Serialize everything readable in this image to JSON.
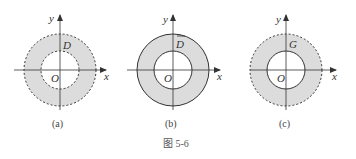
{
  "figure": {
    "caption": "图 5-6",
    "colors": {
      "fill": "#dcdcdc",
      "stroke": "#333333",
      "background": "#ffffff"
    },
    "panels": [
      {
        "id": "a",
        "sublabel": "(a)",
        "region_label": "D",
        "region_overline": false,
        "origin_label": "O",
        "x_axis_label": "x",
        "y_axis_label": "y",
        "outer_boundary": "dashed",
        "inner_boundary": "dashed"
      },
      {
        "id": "b",
        "sublabel": "(b)",
        "region_label": "D",
        "region_overline": true,
        "origin_label": "O",
        "x_axis_label": "x",
        "y_axis_label": "y",
        "outer_boundary": "solid",
        "inner_boundary": "solid"
      },
      {
        "id": "c",
        "sublabel": "(c)",
        "region_label": "G",
        "region_overline": false,
        "origin_label": "O",
        "x_axis_label": "x",
        "y_axis_label": "y",
        "outer_boundary": "dashed",
        "inner_boundary": "solid"
      }
    ]
  }
}
